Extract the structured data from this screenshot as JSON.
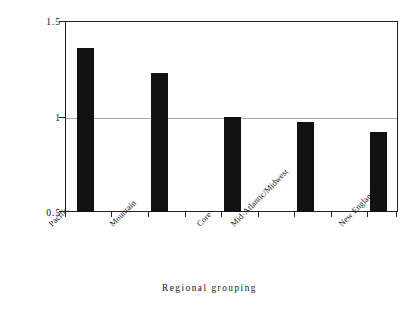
{
  "chart_data": {
    "type": "bar",
    "title": "",
    "subtitle": "",
    "xlabel": "Regional grouping",
    "ylabel": "Odds relative to the traditional core (=1.00)",
    "categories": [
      "Pacific",
      "Mountain",
      "Core",
      "Mid-Atlantic/Midwest",
      "New England"
    ],
    "values": [
      1.36,
      1.23,
      1.0,
      0.97,
      0.92
    ],
    "ylim": [
      0.5,
      1.5
    ],
    "ytick_labels": [
      "1.5",
      "1",
      "0.5"
    ],
    "ytick_values": [
      1.5,
      1.0,
      0.5
    ],
    "grid": "single horizontal reference line at y=1.00",
    "gridline_value": 1.0,
    "legend": "none",
    "legend_position": "none",
    "bar_color": "#111111",
    "gridline_color": "#a8a8a8",
    "axis_color": "#222222",
    "background_color": "#ffffff",
    "xtick_label_rotation": -45
  },
  "axes": {
    "y_title": "Odds relative to the traditional core (=1.00)",
    "x_title": "Regional grouping",
    "y_ticks": [
      {
        "label": "1.5",
        "value": 1.5
      },
      {
        "label": "1",
        "value": 1.0
      },
      {
        "label": "0.5",
        "value": 0.5
      }
    ]
  },
  "bars": [
    {
      "label": "Pacific",
      "value": 1.36
    },
    {
      "label": "Mountain",
      "value": 1.23
    },
    {
      "label": "Core",
      "value": 1.0
    },
    {
      "label": "Mid-Atlantic/Midwest",
      "value": 0.97
    },
    {
      "label": "New England",
      "value": 0.92
    }
  ]
}
